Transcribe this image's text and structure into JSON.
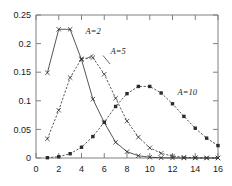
{
  "chart_data": {
    "type": "line",
    "title": "",
    "subtitle": "",
    "xlabel": "",
    "ylabel": "",
    "xlim": [
      0,
      16
    ],
    "ylim": [
      0,
      0.25
    ],
    "grid": false,
    "legend_position": "inline-annotations",
    "x_ticks": [
      "0",
      "2",
      "4",
      "6",
      "8",
      "10",
      "12",
      "14",
      "16"
    ],
    "x_tick_values": [
      0,
      2,
      4,
      6,
      8,
      10,
      12,
      14,
      16
    ],
    "y_ticks": [
      "0",
      "0.05",
      "0.1",
      "0.15",
      "0.2",
      "0.25"
    ],
    "y_tick_values": [
      0,
      0.05,
      0.1,
      0.15,
      0.2,
      0.25
    ],
    "x": [
      0,
      1,
      2,
      3,
      4,
      5,
      6,
      7,
      8,
      9,
      10,
      11,
      12,
      13,
      14,
      15,
      16
    ],
    "series": [
      {
        "name": "A=2",
        "label": "A=2",
        "marker": "x",
        "linestyle": "solid",
        "x": [
          1,
          2,
          3,
          4,
          5,
          6,
          7,
          8,
          9,
          10,
          11,
          12,
          13,
          14,
          15,
          16
        ],
        "values": [
          0.149,
          0.225,
          0.225,
          0.172,
          0.103,
          0.062,
          0.0275,
          0.011,
          0.004,
          0.0013,
          0.0004,
          0.0001,
          0.0,
          0.0,
          0.0,
          0.0
        ]
      },
      {
        "name": "A=5",
        "label": "A=5",
        "marker": "x",
        "linestyle": "dashed",
        "x": [
          1,
          2,
          3,
          4,
          5,
          6,
          7,
          8,
          9,
          10,
          11,
          12,
          13,
          14,
          15,
          16
        ],
        "values": [
          0.0335,
          0.0835,
          0.1405,
          0.1735,
          0.1755,
          0.1465,
          0.1045,
          0.0645,
          0.0365,
          0.0178,
          0.0082,
          0.0034,
          0.0013,
          0.0005,
          0.0002,
          0.0001
        ]
      },
      {
        "name": "A=10",
        "label": "A=10",
        "marker": "square",
        "linestyle": "dashed",
        "x": [
          1,
          2,
          3,
          4,
          5,
          6,
          7,
          8,
          9,
          10,
          11,
          12,
          13,
          14,
          15,
          16
        ],
        "values": [
          0.0005,
          0.0022,
          0.0075,
          0.0188,
          0.0375,
          0.0625,
          0.0901,
          0.1125,
          0.1251,
          0.1251,
          0.1137,
          0.0948,
          0.0728,
          0.0521,
          0.0347,
          0.0217
        ]
      }
    ],
    "annotations": [
      {
        "text": "A=2",
        "x": 4.35,
        "y": 0.2165
      },
      {
        "text": "A=5",
        "x": 6.55,
        "y": 0.1815
      },
      {
        "text": "A=10",
        "x": 12.45,
        "y": 0.1095
      }
    ],
    "colors": {
      "line": "#2b2b2b",
      "axis": "#808080",
      "text": "#1a1a1a",
      "background": "#ffffff"
    }
  }
}
